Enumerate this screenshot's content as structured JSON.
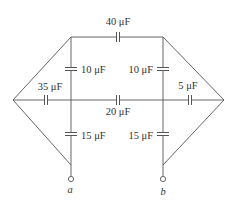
{
  "diagram": {
    "type": "capacitor-network",
    "capacitors": [
      {
        "id": "c_top",
        "label": "40 μF",
        "value_uF": 40,
        "position": "top wire"
      },
      {
        "id": "c_left_upper",
        "label": "10 μF",
        "value_uF": 10,
        "position": "left vertical, upper"
      },
      {
        "id": "c_right_upper",
        "label": "10 μF",
        "value_uF": 10,
        "position": "right vertical, upper"
      },
      {
        "id": "c_mid_left",
        "label": "35 μF",
        "value_uF": 35,
        "position": "middle wire, left"
      },
      {
        "id": "c_mid_center",
        "label": "20 μF",
        "value_uF": 20,
        "position": "middle wire, center"
      },
      {
        "id": "c_mid_right",
        "label": "5 μF",
        "value_uF": 5,
        "position": "middle wire, right"
      },
      {
        "id": "c_left_lower",
        "label": "15 μF",
        "value_uF": 15,
        "position": "left vertical, lower"
      },
      {
        "id": "c_right_lower",
        "label": "15 μF",
        "value_uF": 15,
        "position": "right vertical, lower"
      }
    ],
    "terminals": [
      {
        "id": "a",
        "label": "a"
      },
      {
        "id": "b",
        "label": "b"
      }
    ],
    "colors": {
      "wire": "#555555",
      "text": "#333333",
      "background": "#ffffff"
    }
  }
}
